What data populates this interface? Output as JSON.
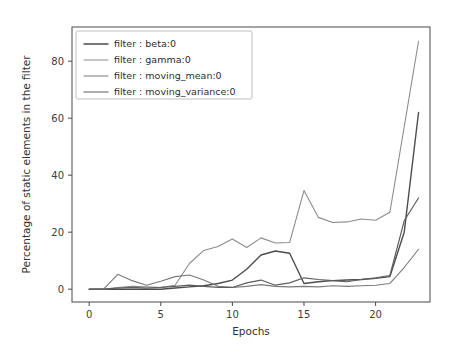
{
  "chart_data": {
    "type": "line",
    "title": "",
    "xlabel": "Epochs",
    "ylabel": "Percentage of static elements in the filter",
    "xlim": [
      -1.2,
      23.8
    ],
    "ylim": [
      -4.5,
      92
    ],
    "xticks": [
      0,
      5,
      10,
      15,
      20
    ],
    "xtick_labels": [
      "0",
      "5",
      "10",
      "15",
      "20"
    ],
    "yticks": [
      0,
      20,
      40,
      60,
      80
    ],
    "ytick_labels": [
      "0",
      "20",
      "40",
      "60",
      "80"
    ],
    "grid": false,
    "legend_position": "upper left",
    "x": [
      0,
      1,
      2,
      3,
      4,
      5,
      6,
      7,
      8,
      9,
      10,
      11,
      12,
      13,
      14,
      15,
      16,
      17,
      18,
      19,
      20,
      21,
      22,
      23
    ],
    "series": [
      {
        "name": "filter : beta:0",
        "label": "filter : beta:0",
        "color": "#4d4d4d",
        "width": 1.4,
        "values": [
          0,
          0,
          0,
          0,
          0,
          0,
          0.4,
          0.8,
          1.2,
          2.0,
          3.2,
          7.0,
          12.0,
          13.4,
          12.6,
          2.0,
          2.6,
          3.0,
          3.2,
          3.4,
          3.8,
          4.4,
          20.0,
          62.0
        ]
      },
      {
        "name": "filter : gamma:0",
        "label": "filter : gamma:0",
        "color": "#8c8c8c",
        "width": 1.1,
        "values": [
          0,
          0,
          0.6,
          1.0,
          0.8,
          0.6,
          1.4,
          9.0,
          13.6,
          15.0,
          17.6,
          14.6,
          18.0,
          16.2,
          16.4,
          34.6,
          25.2,
          23.4,
          23.6,
          24.6,
          24.2,
          27.0,
          57.0,
          87.0
        ]
      },
      {
        "name": "filter : moving_mean:0",
        "label": "filter : moving_mean:0",
        "color": "#7a7a7a",
        "width": 1.1,
        "values": [
          0,
          0,
          5.2,
          3.0,
          1.4,
          2.8,
          4.4,
          5.0,
          3.2,
          1.0,
          0.6,
          1.0,
          1.6,
          1.0,
          0.8,
          1.0,
          0.8,
          1.2,
          1.0,
          1.2,
          1.4,
          2.0,
          7.6,
          14.0
        ]
      },
      {
        "name": "filter : moving_variance:0",
        "label": "filter : moving_variance:0",
        "color": "#5e5e5e",
        "width": 1.2,
        "values": [
          0,
          0,
          0.4,
          0.6,
          0.4,
          0.6,
          1.0,
          1.4,
          1.0,
          0.6,
          0.6,
          2.2,
          3.2,
          1.4,
          2.2,
          4.0,
          3.4,
          3.0,
          2.6,
          3.4,
          4.0,
          4.8,
          24.0,
          32.0
        ]
      }
    ]
  },
  "figure": {
    "background": "#ffffff",
    "axes_color": "#4a4a4a"
  }
}
